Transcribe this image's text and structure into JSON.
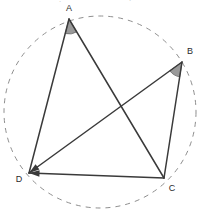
{
  "figure": {
    "kind": "euclidean-geometry-diagram",
    "width": 206,
    "height": 214,
    "background_color": "#ffffff",
    "stroke_color": "#3a3a3a",
    "dashed_color": "#8e8e8e",
    "wedge_fill_color": "#9a9a9a",
    "wedge_stroke_color": "#6a6a6a",
    "label_color": "#2b2b2b"
  },
  "vertices": [
    {
      "id": "A",
      "label": "A",
      "x": 69,
      "y": 19,
      "label_x": 69,
      "label_y": 9
    },
    {
      "id": "B",
      "label": "B",
      "x": 182,
      "y": 62,
      "label_x": 190,
      "label_y": 52
    },
    {
      "id": "C",
      "label": "C",
      "x": 164,
      "y": 178,
      "label_x": 172,
      "label_y": 189
    },
    {
      "id": "D",
      "label": "D",
      "x": 29,
      "y": 173,
      "label_x": 19,
      "label_y": 180
    }
  ],
  "segments": [
    {
      "id": "AD",
      "from": "A",
      "to": "D",
      "style": "solid",
      "arrow": false
    },
    {
      "id": "AC",
      "from": "A",
      "to": "C",
      "style": "solid",
      "arrow": false
    },
    {
      "id": "BC",
      "from": "B",
      "to": "C",
      "style": "solid",
      "arrow": false
    },
    {
      "id": "DB",
      "from": "D",
      "to": "B",
      "style": "solid",
      "arrow": true
    },
    {
      "id": "DC",
      "from": "D",
      "to": "C",
      "style": "solid",
      "arrow": true
    }
  ],
  "angle_marks": [
    {
      "id": "angle-A",
      "at": "A",
      "between": [
        "D",
        "C"
      ],
      "radius": 15,
      "shaded": true
    },
    {
      "id": "angle-B",
      "at": "B",
      "between": [
        "D",
        "C"
      ],
      "radius": 15,
      "shaded": true
    }
  ],
  "circle": {
    "id": "circumcircle",
    "style": "dashed",
    "center_x": 100,
    "center_y": 112,
    "radius": 96,
    "dash_pattern": "5 5",
    "passes_through": [
      "B",
      "C",
      "D"
    ]
  },
  "artifacts": {
    "top_fragments": [
      {
        "text": "·",
        "x": 60,
        "y": 4
      },
      {
        "text": "·",
        "x": 130,
        "y": 3
      }
    ]
  }
}
